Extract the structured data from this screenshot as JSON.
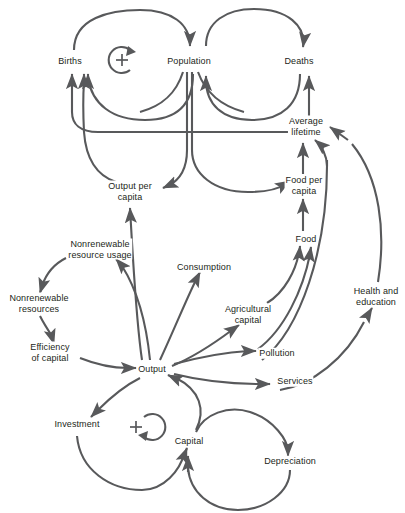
{
  "diagram": {
    "type": "causal-loop-diagram",
    "stroke_color": "#58595b",
    "text_color": "#231f20",
    "background": "#ffffff",
    "nodes": [
      {
        "id": "births",
        "label": "Births",
        "x": 70,
        "y": 61
      },
      {
        "id": "population",
        "label": "Population",
        "x": 189,
        "y": 61
      },
      {
        "id": "deaths",
        "label": "Deaths",
        "x": 299,
        "y": 61
      },
      {
        "id": "average-lifetime",
        "label": "Average\nlifetime",
        "x": 306,
        "y": 126
      },
      {
        "id": "output-per-capita",
        "label": "Output per\ncapita",
        "x": 130,
        "y": 191
      },
      {
        "id": "food-per-capita",
        "label": "Food per\ncapita",
        "x": 304,
        "y": 185
      },
      {
        "id": "food",
        "label": "Food",
        "x": 306,
        "y": 239
      },
      {
        "id": "nonrenewable-usage",
        "label": "Nonrenewable\nresource usage",
        "x": 100,
        "y": 249
      },
      {
        "id": "consumption",
        "label": "Consumption",
        "x": 204,
        "y": 267
      },
      {
        "id": "health-education",
        "label": "Health and\neducation",
        "x": 376,
        "y": 296
      },
      {
        "id": "nonrenewable-res",
        "label": "Nonrenewable\nresources",
        "x": 39,
        "y": 303
      },
      {
        "id": "agricultural-capital",
        "label": "Agricultural\ncapital",
        "x": 248,
        "y": 314
      },
      {
        "id": "efficiency-capital",
        "label": "Efficiency\nof capital",
        "x": 50,
        "y": 352
      },
      {
        "id": "output",
        "label": "Output",
        "x": 152,
        "y": 369
      },
      {
        "id": "pollution",
        "label": "Pollution",
        "x": 277,
        "y": 353
      },
      {
        "id": "services",
        "label": "Services",
        "x": 295,
        "y": 381
      },
      {
        "id": "investment",
        "label": "Investment",
        "x": 77,
        "y": 424
      },
      {
        "id": "capital",
        "label": "Capital",
        "x": 189,
        "y": 441
      },
      {
        "id": "depreciation",
        "label": "Depreciation",
        "x": 290,
        "y": 461
      }
    ],
    "loop_markers": [
      {
        "id": "population-loop-marker",
        "sign": "+",
        "polarity": "reinforcing",
        "x": 122,
        "y": 60,
        "arrow_position": "top-right"
      },
      {
        "id": "capital-loop-marker",
        "sign": "+",
        "polarity": "reinforcing",
        "x": 136,
        "y": 427,
        "arrow_position": "bottom-right"
      }
    ],
    "links": [
      {
        "from": "births",
        "to": "population",
        "polarity": "positive"
      },
      {
        "from": "population",
        "to": "births",
        "polarity": "positive"
      },
      {
        "from": "population",
        "to": "deaths",
        "polarity": "positive"
      },
      {
        "from": "deaths",
        "to": "population",
        "polarity": "negative"
      },
      {
        "from": "average-lifetime",
        "to": "deaths",
        "polarity": "negative"
      },
      {
        "from": "average-lifetime",
        "to": "births",
        "polarity": "positive"
      },
      {
        "from": "population",
        "to": "output-per-capita",
        "polarity": "negative"
      },
      {
        "from": "population",
        "to": "food-per-capita",
        "polarity": "negative"
      },
      {
        "from": "output-per-capita",
        "to": "births",
        "polarity": "negative"
      },
      {
        "from": "food-per-capita",
        "to": "average-lifetime",
        "polarity": "positive"
      },
      {
        "from": "food",
        "to": "food-per-capita",
        "polarity": "positive"
      },
      {
        "from": "agricultural-capital",
        "to": "food",
        "polarity": "positive"
      },
      {
        "from": "pollution",
        "to": "food",
        "polarity": "negative"
      },
      {
        "from": "pollution",
        "to": "average-lifetime",
        "polarity": "negative"
      },
      {
        "from": "health-education",
        "to": "average-lifetime",
        "polarity": "positive"
      },
      {
        "from": "services",
        "to": "health-education",
        "polarity": "positive"
      },
      {
        "from": "output",
        "to": "output-per-capita",
        "polarity": "positive"
      },
      {
        "from": "output",
        "to": "nonrenewable-usage",
        "polarity": "positive"
      },
      {
        "from": "nonrenewable-usage",
        "to": "nonrenewable-res",
        "polarity": "negative"
      },
      {
        "from": "nonrenewable-res",
        "to": "efficiency-capital",
        "polarity": "positive"
      },
      {
        "from": "efficiency-capital",
        "to": "output",
        "polarity": "positive"
      },
      {
        "from": "output",
        "to": "consumption",
        "polarity": "positive"
      },
      {
        "from": "output",
        "to": "agricultural-capital",
        "polarity": "positive"
      },
      {
        "from": "output",
        "to": "pollution",
        "polarity": "positive"
      },
      {
        "from": "output",
        "to": "services",
        "polarity": "positive"
      },
      {
        "from": "output",
        "to": "investment",
        "polarity": "positive"
      },
      {
        "from": "investment",
        "to": "capital",
        "polarity": "positive"
      },
      {
        "from": "capital",
        "to": "output",
        "polarity": "positive"
      },
      {
        "from": "capital",
        "to": "depreciation",
        "polarity": "positive"
      },
      {
        "from": "depreciation",
        "to": "capital",
        "polarity": "negative"
      }
    ]
  }
}
